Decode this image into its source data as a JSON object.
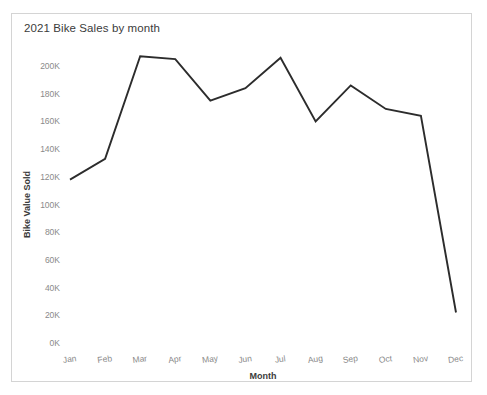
{
  "card": {
    "title": "2021 Bike Sales by month"
  },
  "chart_data": {
    "type": "line",
    "title": "2021 Bike Sales by month",
    "xlabel": "Month",
    "ylabel": "Bike Value Sold",
    "categories": [
      "Jan",
      "Feb",
      "Mar",
      "Apr",
      "May",
      "Jun",
      "Jul",
      "Aug",
      "Sep",
      "Oct",
      "Nov",
      "Dec"
    ],
    "values": [
      118000,
      133000,
      207000,
      205000,
      175000,
      184000,
      206000,
      160000,
      186000,
      169000,
      164000,
      22000
    ],
    "series": [
      {
        "name": "Bike Value Sold",
        "values": [
          118000,
          133000,
          207000,
          205000,
          175000,
          184000,
          206000,
          160000,
          186000,
          169000,
          164000,
          22000
        ]
      }
    ],
    "ylim": [
      0,
      210000
    ],
    "ytick_values": [
      0,
      20000,
      40000,
      60000,
      80000,
      100000,
      120000,
      140000,
      160000,
      180000,
      200000
    ],
    "ytick_labels": [
      "0K",
      "20K",
      "40K",
      "60K",
      "80K",
      "100K",
      "120K",
      "140K",
      "160K",
      "180K",
      "200K"
    ],
    "xtick_labels": [
      "Jan",
      "Feb",
      "Mar",
      "Apr",
      "May",
      "Jun",
      "Jul",
      "Aug",
      "Sep",
      "Oct",
      "Nov",
      "Dec"
    ],
    "grid": false,
    "legend": "none",
    "line_color": "#2c2c2c"
  }
}
